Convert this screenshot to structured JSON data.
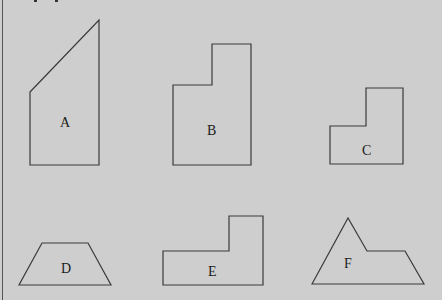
{
  "figure": {
    "background_color": "#cecece",
    "stroke_color": "#3a3a3a",
    "shapes": [
      {
        "label": "A",
        "type": "quadrilateral",
        "points": "30,92 99,20 99,165 30,165",
        "label_x": 65,
        "label_y": 122
      },
      {
        "label": "B",
        "type": "L-shaped hexagon",
        "points": "173,85 212,85 212,44 251,44 251,165 173,165",
        "label_x": 212,
        "label_y": 130
      },
      {
        "label": "C",
        "type": "L-shaped hexagon",
        "points": "330,126 366,126 366,88 403,88 403,164 330,164",
        "label_x": 367,
        "label_y": 150
      },
      {
        "label": "D",
        "type": "trapezoid",
        "points": "42,243 88,243 111,285 19,285",
        "label_x": 66,
        "label_y": 271
      },
      {
        "label": "E",
        "type": "L-shaped hexagon",
        "points": "163,251 229,251 229,216 263,216 263,285 163,285",
        "label_x": 213,
        "label_y": 274
      },
      {
        "label": "F",
        "type": "pentagon",
        "points": "312,284 348,218 367,251 405,251 424,284",
        "label_x": 348,
        "label_y": 267
      }
    ]
  }
}
